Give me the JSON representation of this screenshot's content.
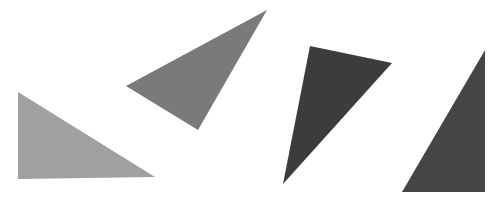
{
  "canvas": {
    "width": 502,
    "height": 200,
    "background": "#ffffff"
  },
  "shapes": [
    {
      "id": "triangle-1",
      "type": "triangle",
      "fill": "#a0a0a0",
      "points": [
        [
          18,
          92
        ],
        [
          18,
          179
        ],
        [
          155,
          177
        ]
      ]
    },
    {
      "id": "triangle-2",
      "type": "triangle",
      "fill": "#7a7a7a",
      "points": [
        [
          126,
          86
        ],
        [
          267,
          10
        ],
        [
          198,
          130
        ]
      ]
    },
    {
      "id": "triangle-3",
      "type": "triangle",
      "fill": "#3c3c3c",
      "points": [
        [
          310,
          46
        ],
        [
          392,
          63
        ],
        [
          283,
          184
        ]
      ]
    },
    {
      "id": "triangle-4",
      "type": "triangle",
      "fill": "#454545",
      "points": [
        [
          485,
          50
        ],
        [
          485,
          192
        ],
        [
          402,
          192
        ]
      ]
    }
  ]
}
